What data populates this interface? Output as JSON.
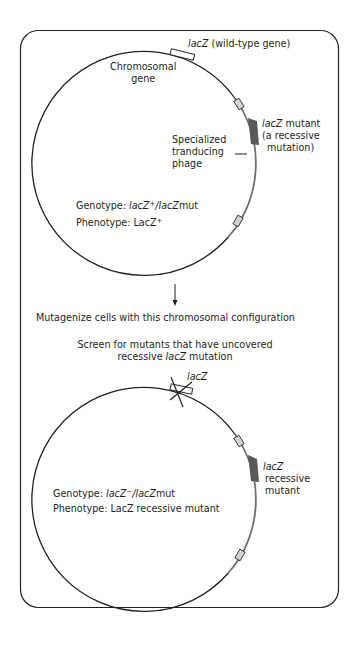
{
  "colors": {
    "stroke": "#231f20",
    "phage": "#6d6e71",
    "mutant_block": "#58595b",
    "att_box_fill": "#d1d3d4",
    "background": "#ffffff"
  },
  "top_panel": {
    "wildtype_label": {
      "gene": "lacZ",
      "suffix": " (wild-type gene)"
    },
    "chromosomal_gene_label": [
      "Chromosomal",
      "gene"
    ],
    "mutant_label": {
      "gene": "lacZ",
      "line1_suffix": " mutant",
      "line2": "(a recessive",
      "line3": "mutation)"
    },
    "phage_label": [
      "Specialized",
      "tranducing",
      "phage"
    ],
    "genotype": {
      "prefix": "Genotype: ",
      "allele1": "lacZ",
      "allele1_sup": "+",
      "sep": "/",
      "allele2": "lacZ",
      "allele2_suffix": "mut"
    },
    "phenotype": {
      "prefix": "Phenotype: LacZ",
      "sup": "+"
    }
  },
  "steps": {
    "mutagenize": "Mutagenize cells with this chromosomal configuration",
    "screen_line1": "Screen for mutants that have uncovered",
    "screen_line2_prefix": "recessive ",
    "screen_line2_gene": "lacZ",
    "screen_line2_suffix": " mutation"
  },
  "bottom_panel": {
    "knocked_label": "lacZ",
    "mutant_label": {
      "gene": "lacZ",
      "line2": "recessive",
      "line3": "mutant"
    },
    "genotype": {
      "prefix": "Genotype: ",
      "allele1": "lacZ",
      "allele1_sup": "−",
      "sep": "/",
      "allele2": "lacZ",
      "allele2_suffix": "mut"
    },
    "phenotype": "Phenotype: LacZ recessive mutant"
  }
}
